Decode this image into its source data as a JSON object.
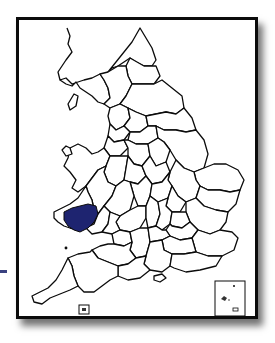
{
  "map": {
    "region": "England and Wales",
    "division": "counties",
    "highlighted_county": "Carmarthenshire",
    "colors": {
      "highlight": "#1e2470",
      "border": "#0b0b0b",
      "land": "#ffffff",
      "marker": "#3a4180"
    },
    "insets": [
      {
        "name": "isles-of-scilly-inset"
      },
      {
        "name": "channel-islands-inset"
      }
    ]
  }
}
